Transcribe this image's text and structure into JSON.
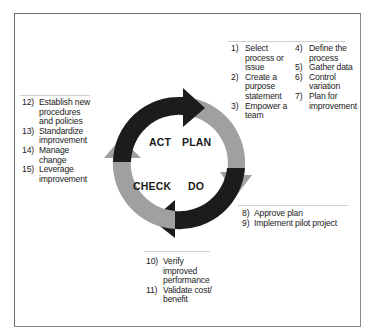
{
  "diagram": {
    "phases": [
      {
        "label": "PLAN",
        "color": "#a0a0a0"
      },
      {
        "label": "DO",
        "color": "#1c1c1c"
      },
      {
        "label": "CHECK",
        "color": "#a0a0a0"
      },
      {
        "label": "ACT",
        "color": "#1c1c1c"
      }
    ]
  },
  "plan_steps": {
    "col1": [
      {
        "num": "1)",
        "text": "Select process or issue"
      },
      {
        "num": "2)",
        "text": "Create a purpose statement"
      },
      {
        "num": "3)",
        "text": "Empower a team"
      }
    ],
    "col2": [
      {
        "num": "4)",
        "text": "Define the process"
      },
      {
        "num": "5)",
        "text": "Gather data"
      },
      {
        "num": "6)",
        "text": "Control variation"
      },
      {
        "num": "7)",
        "text": "Plan for improvement"
      }
    ]
  },
  "do_steps": [
    {
      "num": "8)",
      "text": "Approve plan"
    },
    {
      "num": "9)",
      "text": "Implement pilot project"
    }
  ],
  "check_steps": [
    {
      "num": "10)",
      "text": "Verify improved performance"
    },
    {
      "num": "11)",
      "text": "Validate cost/ benefit"
    }
  ],
  "act_steps": [
    {
      "num": "12)",
      "text": "Establish new procedures and policies"
    },
    {
      "num": "13)",
      "text": "Standardize improvement"
    },
    {
      "num": "14)",
      "text": "Manage change"
    },
    {
      "num": "15)",
      "text": "Leverage improvement"
    }
  ]
}
